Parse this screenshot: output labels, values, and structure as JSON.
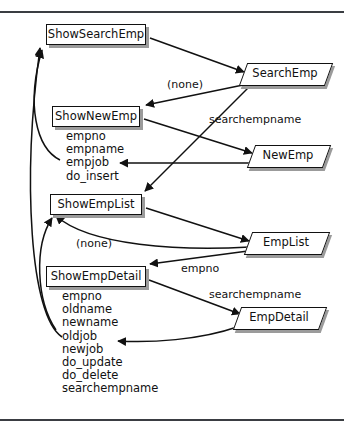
{
  "diagram": {
    "type": "dataflow-navigation-diagram",
    "rules": [
      "top-rule",
      "bottom-rule"
    ],
    "processes": [
      {
        "id": "ShowSearchEmp",
        "label": "ShowSearchEmp",
        "x": 46,
        "y": 24,
        "w": 100,
        "h": 21,
        "fields": []
      },
      {
        "id": "ShowNewEmp",
        "label": "ShowNewEmp",
        "x": 52,
        "y": 106,
        "w": 88,
        "h": 21,
        "fields": [
          "empno",
          "empname",
          "empjob",
          "do_insert"
        ],
        "fields_x": 66,
        "fields_y": 130
      },
      {
        "id": "ShowEmpList",
        "label": "ShowEmpList",
        "x": 50,
        "y": 194,
        "w": 92,
        "h": 21,
        "fields": []
      },
      {
        "id": "ShowEmpDetail",
        "label": "ShowEmpDetail",
        "x": 46,
        "y": 266,
        "w": 100,
        "h": 21,
        "fields": [
          "empno",
          "oldname",
          "newname",
          "oldjob",
          "newjob",
          "do_update",
          "do_delete",
          "searchempname"
        ],
        "fields_x": 62,
        "fields_y": 290
      }
    ],
    "data_nodes": [
      {
        "id": "SearchEmp",
        "label": "SearchEmp",
        "x": 243,
        "y": 63,
        "w": 84,
        "h": 21
      },
      {
        "id": "NewEmp",
        "label": "NewEmp",
        "x": 251,
        "y": 145,
        "w": 74,
        "h": 21
      },
      {
        "id": "EmpList",
        "label": "EmpList",
        "x": 248,
        "y": 232,
        "w": 76,
        "h": 21
      },
      {
        "id": "EmpDetail",
        "label": "EmpDetail",
        "x": 237,
        "y": 307,
        "w": 84,
        "h": 21
      }
    ],
    "edge_labels": [
      {
        "id": "label-none-1",
        "text": "(none)",
        "x": 167,
        "y": 79
      },
      {
        "id": "label-searchempname-1",
        "text": "searchempname",
        "x": 209,
        "y": 114
      },
      {
        "id": "label-none-2",
        "text": "(none)",
        "x": 76,
        "y": 238
      },
      {
        "id": "label-empno",
        "text": "empno",
        "x": 181,
        "y": 263
      },
      {
        "id": "label-searchempname-2",
        "text": "searchempname",
        "x": 209,
        "y": 289
      }
    ],
    "edges": [
      {
        "from": "ShowSearchEmp",
        "to": "SearchEmp",
        "label": ""
      },
      {
        "from": "SearchEmp",
        "to": "ShowNewEmp",
        "label": "(none)"
      },
      {
        "from": "SearchEmp",
        "to": "ShowEmpList",
        "label": "searchempname"
      },
      {
        "from": "ShowNewEmp",
        "to": "NewEmp",
        "label": ""
      },
      {
        "from": "NewEmp",
        "to": "ShowNewEmp",
        "label": ""
      },
      {
        "from": "ShowNewEmp",
        "to": "ShowSearchEmp",
        "label": ""
      },
      {
        "from": "ShowEmpList",
        "to": "EmpList",
        "label": ""
      },
      {
        "from": "EmpList",
        "to": "ShowEmpDetail",
        "label": "empno"
      },
      {
        "from": "EmpList",
        "to": "ShowEmpList",
        "label": "(none)"
      },
      {
        "from": "ShowEmpDetail",
        "to": "EmpDetail",
        "label": "searchempname"
      },
      {
        "from": "EmpDetail",
        "to": "ShowEmpDetail",
        "label": ""
      },
      {
        "from": "ShowEmpDetail",
        "to": "ShowSearchEmp",
        "label": ""
      }
    ],
    "colors": {
      "stroke": "#111111",
      "shadow": "#9b9b9b",
      "rule": "#3a3d42",
      "background": "#ffffff"
    }
  }
}
